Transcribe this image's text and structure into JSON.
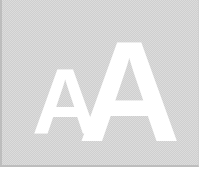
{
  "icon": {
    "name": "font-size-icon",
    "small_letter": "A",
    "large_letter": "A"
  },
  "colors": {
    "panel_background": "#dcdcdc",
    "glyph": "#ffffff",
    "border": "#bdbdbd"
  }
}
